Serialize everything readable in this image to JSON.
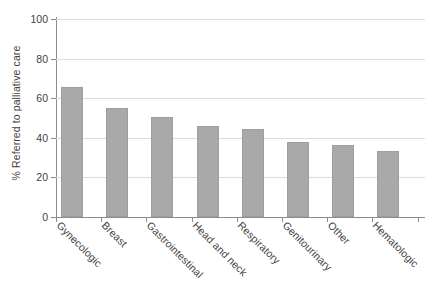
{
  "chart_data": {
    "type": "bar",
    "title": "",
    "xlabel": "",
    "ylabel": "% Referred to palliative care",
    "ylim": [
      0,
      100
    ],
    "yticks": [
      0,
      20,
      40,
      60,
      80,
      100
    ],
    "ytick_labels": [
      "0",
      "20",
      "40",
      "60",
      "80",
      "100"
    ],
    "grid": true,
    "legend": false,
    "bar_color": "#a9a9a9",
    "categories": [
      "Gynecologic",
      "Breast",
      "Gastrointestinal",
      "Head and neck",
      "Respiratory",
      "Genitourinary",
      "Other",
      "Hematologic"
    ],
    "values": [
      65.5,
      55,
      50.5,
      46,
      44.5,
      38,
      36.5,
      33.5
    ]
  }
}
